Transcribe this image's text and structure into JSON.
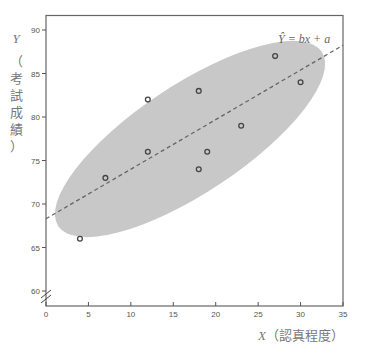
{
  "chart_data": {
    "type": "scatter",
    "title": "",
    "xlabel": "X（認真程度）",
    "ylabel": "Y（考試成績）",
    "x_var": "X",
    "x_desc": "（認真程度）",
    "y_var": "Y",
    "y_desc_chars": [
      "（",
      "考",
      "試",
      "成",
      "績",
      "）"
    ],
    "xlim": [
      0,
      35
    ],
    "ylim": [
      60,
      90
    ],
    "x_ticks": [
      "0",
      "5",
      "10",
      "15",
      "20",
      "25",
      "30",
      "35"
    ],
    "y_ticks": [
      "60",
      "65",
      "70",
      "75",
      "80",
      "85",
      "90"
    ],
    "y_axis_break": true,
    "grid": false,
    "points": [
      {
        "x": 4,
        "y": 66
      },
      {
        "x": 7,
        "y": 73
      },
      {
        "x": 12,
        "y": 76
      },
      {
        "x": 12,
        "y": 82
      },
      {
        "x": 18,
        "y": 74
      },
      {
        "x": 18,
        "y": 83
      },
      {
        "x": 19,
        "y": 76
      },
      {
        "x": 23,
        "y": 79
      },
      {
        "x": 27,
        "y": 87
      },
      {
        "x": 30,
        "y": 84
      }
    ],
    "regression_line": {
      "label": "Ŷ = bx + a",
      "intercept": 68.3,
      "slope": 0.57,
      "style": "dashed"
    },
    "annotation": "Ŷ = bx + a",
    "confidence_ellipse": true,
    "colors": {
      "ellipse": "#c8c8c8",
      "points": "#444444",
      "line": "#666666",
      "axis": "#555555"
    }
  }
}
